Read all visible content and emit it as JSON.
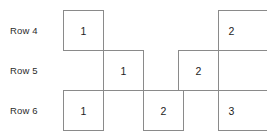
{
  "diagram": {
    "type": "staircase-grid",
    "background_color": "#ffffff",
    "line_color": "#8a8a8a",
    "text_color": "#1d1d1d",
    "rows": [
      {
        "label": "Row 4",
        "label_x": 10,
        "label_y": 26,
        "cells": [
          {
            "value": "1",
            "x": 63,
            "y": 10,
            "w": 41,
            "h": 41,
            "clipped_right": false
          },
          {
            "value": "2",
            "x": 218,
            "y": 10,
            "w": 56,
            "h": 41,
            "clipped_right": true
          }
        ]
      },
      {
        "label": "Row 5",
        "label_x": 10,
        "label_y": 66,
        "cells": [
          {
            "value": "1",
            "x": 103,
            "y": 50,
            "w": 41,
            "h": 41,
            "clipped_right": false
          },
          {
            "value": "2",
            "x": 178,
            "y": 50,
            "w": 41,
            "h": 41,
            "clipped_right": false
          }
        ]
      },
      {
        "label": "Row 6",
        "label_x": 10,
        "label_y": 106,
        "cells": [
          {
            "value": "1",
            "x": 63,
            "y": 90,
            "w": 41,
            "h": 41,
            "clipped_right": false
          },
          {
            "value": "2",
            "x": 143,
            "y": 90,
            "w": 41,
            "h": 41,
            "clipped_right": false
          },
          {
            "value": "3",
            "x": 218,
            "y": 90,
            "w": 56,
            "h": 41,
            "clipped_right": true
          }
        ]
      }
    ],
    "connector_lines": [
      {
        "x": 63,
        "y": 50,
        "w": 81
      },
      {
        "x": 178,
        "y": 50,
        "w": 89
      },
      {
        "x": 63,
        "y": 90,
        "w": 204
      }
    ]
  }
}
